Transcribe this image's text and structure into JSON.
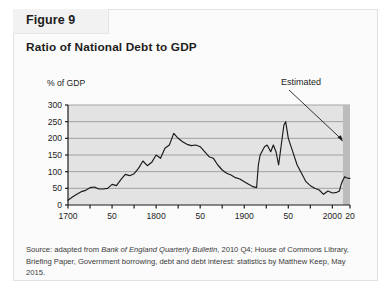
{
  "figure": {
    "tab_label": "Figure 9",
    "title": "Ratio of National Debt to GDP"
  },
  "source": {
    "prefix": "Source: adapted from ",
    "italic_1": "Bank of England Quarterly Bulletin",
    "middle": ", 2010 Q4; House of Commons Library, Briefing Paper, Government borrowing, debt and debt interest: statistics by Matthew Keep, May 2015."
  },
  "colors": {
    "plot_background": "#e3e3e3",
    "gridline": "#9a9a9a",
    "axis": "#1d1d1d",
    "series_line": "#1a1a1a",
    "estimated_band": "#bcbcbc",
    "card_background": "#fbfbfb",
    "tab_background": "#f2f2f2"
  },
  "chart_data": {
    "type": "line",
    "title": "Ratio of National Debt to GDP",
    "xlabel": "",
    "ylabel": "% of GDP",
    "ylim": [
      0,
      300
    ],
    "xlim": [
      1700,
      2020
    ],
    "ytick_labels": [
      "0",
      "50",
      "100",
      "150",
      "200",
      "250",
      "300"
    ],
    "yticks": [
      0,
      50,
      100,
      150,
      200,
      250,
      300
    ],
    "xtick_labels": [
      "1700",
      "50",
      "1800",
      "50",
      "1900",
      "50",
      "2000",
      "20"
    ],
    "xticks": [
      1700,
      1750,
      1800,
      1850,
      1900,
      1950,
      2000,
      2020
    ],
    "minor_xticks": [
      1725,
      1775,
      1825,
      1875,
      1925,
      1975
    ],
    "grid": "horizontal",
    "legend": "none",
    "annotations": [
      {
        "text": "Estimated",
        "points_to_year": 2012,
        "points_to_value": 190,
        "note": "leader line from label down-right to shaded forecast band"
      }
    ],
    "shaded_regions": [
      {
        "label": "Estimated",
        "x_start": 2012,
        "x_end": 2020
      }
    ],
    "series": [
      {
        "name": "National debt as % of GDP",
        "x": [
          1700,
          1705,
          1710,
          1715,
          1720,
          1725,
          1730,
          1735,
          1740,
          1745,
          1750,
          1755,
          1760,
          1765,
          1770,
          1775,
          1780,
          1785,
          1790,
          1795,
          1800,
          1805,
          1810,
          1815,
          1820,
          1825,
          1830,
          1835,
          1840,
          1845,
          1850,
          1855,
          1860,
          1865,
          1870,
          1875,
          1880,
          1885,
          1890,
          1895,
          1900,
          1905,
          1910,
          1914,
          1916,
          1918,
          1920,
          1923,
          1926,
          1930,
          1933,
          1936,
          1939,
          1942,
          1945,
          1947,
          1950,
          1955,
          1960,
          1965,
          1970,
          1975,
          1980,
          1985,
          1990,
          1995,
          2000,
          2005,
          2008,
          2010,
          2012,
          2014,
          2016,
          2018,
          2020
        ],
        "y": [
          14,
          24,
          32,
          40,
          44,
          52,
          54,
          48,
          48,
          50,
          62,
          58,
          76,
          92,
          88,
          94,
          110,
          132,
          118,
          128,
          150,
          140,
          170,
          180,
          215,
          200,
          190,
          182,
          178,
          180,
          175,
          160,
          145,
          140,
          120,
          105,
          95,
          90,
          82,
          78,
          70,
          62,
          55,
          52,
          120,
          150,
          160,
          175,
          180,
          160,
          180,
          160,
          120,
          180,
          240,
          250,
          200,
          160,
          120,
          95,
          70,
          58,
          50,
          45,
          32,
          42,
          36,
          38,
          42,
          62,
          75,
          85,
          82,
          80,
          80
        ]
      }
    ],
    "peaks_description": [
      {
        "year": 1820,
        "value": 215,
        "event": "Napoleonic Wars peak"
      },
      {
        "year": 1947,
        "value": 250,
        "event": "Post-WWII peak"
      },
      {
        "year": 1918,
        "value": 150,
        "event": "WWI rise"
      },
      {
        "year": 2010,
        "value": 75,
        "event": "Financial crisis spike"
      }
    ]
  }
}
